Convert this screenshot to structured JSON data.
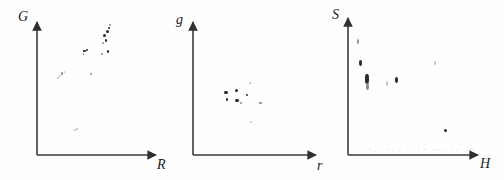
{
  "figure": {
    "type": "scatter-panel-figure",
    "panel_count": 3,
    "background_color": "#ffffff",
    "ink_color": "#2b2b2b",
    "axis_color": "#3a3a3a"
  },
  "chart_data": [
    {
      "type": "scatter",
      "title": "",
      "subtitle": "",
      "xlabel": "R",
      "ylabel": "G",
      "xlim": [
        0,
        1
      ],
      "ylim": [
        0,
        1
      ],
      "grid": false,
      "legend": "none",
      "annotations": [],
      "xticklabels": [],
      "yticklabels": [],
      "points": [
        {
          "x": 0.565,
          "y": 0.895,
          "size": 3.0,
          "tone": "dark"
        },
        {
          "x": 0.59,
          "y": 0.93,
          "size": 3.4,
          "tone": "dark"
        },
        {
          "x": 0.605,
          "y": 0.955,
          "size": 2.8,
          "tone": "dark"
        },
        {
          "x": 0.58,
          "y": 0.862,
          "size": 2.6,
          "tone": "dark"
        },
        {
          "x": 0.552,
          "y": 0.84,
          "size": 2.2,
          "tone": "soft"
        },
        {
          "x": 0.612,
          "y": 0.975,
          "size": 2.0,
          "tone": "soft"
        },
        {
          "x": 0.598,
          "y": 0.778,
          "size": 2.6,
          "tone": "dark"
        },
        {
          "x": 0.545,
          "y": 0.76,
          "size": 1.8,
          "tone": "soft"
        },
        {
          "x": 0.4,
          "y": 0.782,
          "size": 2.6,
          "tone": "dark"
        },
        {
          "x": 0.418,
          "y": 0.79,
          "size": 2.4,
          "tone": "dark"
        },
        {
          "x": 0.39,
          "y": 0.762,
          "size": 1.8,
          "tone": "soft"
        },
        {
          "x": 0.452,
          "y": 0.612,
          "size": 1.8,
          "tone": "soft"
        },
        {
          "x": 0.21,
          "y": 0.612,
          "size": 2.4,
          "tone": "soft"
        },
        {
          "x": 0.192,
          "y": 0.592,
          "size": 1.8,
          "tone": "faint"
        },
        {
          "x": 0.178,
          "y": 0.578,
          "size": 1.6,
          "tone": "faint"
        },
        {
          "x": 0.232,
          "y": 0.622,
          "size": 1.6,
          "tone": "faint"
        },
        {
          "x": 0.322,
          "y": 0.185,
          "size": 1.8,
          "tone": "faint"
        },
        {
          "x": 0.336,
          "y": 0.196,
          "size": 1.4,
          "tone": "faint"
        }
      ]
    },
    {
      "type": "scatter",
      "title": "",
      "subtitle": "",
      "xlabel": "r",
      "ylabel": "g",
      "xlim": [
        0,
        1
      ],
      "ylim": [
        0,
        1
      ],
      "grid": false,
      "legend": "none",
      "annotations": [],
      "xticklabels": [],
      "yticklabels": [],
      "points": [
        {
          "x": 0.268,
          "y": 0.47,
          "size": 3.2,
          "tone": "dark"
        },
        {
          "x": 0.276,
          "y": 0.418,
          "size": 2.6,
          "tone": "dark"
        },
        {
          "x": 0.352,
          "y": 0.488,
          "size": 3.0,
          "tone": "dark"
        },
        {
          "x": 0.358,
          "y": 0.408,
          "size": 3.4,
          "tone": "dark"
        },
        {
          "x": 0.388,
          "y": 0.392,
          "size": 2.2,
          "tone": "soft"
        },
        {
          "x": 0.438,
          "y": 0.452,
          "size": 2.2,
          "tone": "dark"
        },
        {
          "x": 0.462,
          "y": 0.54,
          "size": 1.6,
          "tone": "faint"
        },
        {
          "x": 0.548,
          "y": 0.392,
          "size": 2.4,
          "tone": "soft"
        },
        {
          "x": 0.47,
          "y": 0.248,
          "size": 1.8,
          "tone": "faint"
        }
      ]
    },
    {
      "type": "scatter",
      "title": "",
      "subtitle": "",
      "xlabel": "H",
      "ylabel": "S",
      "xlim": [
        0,
        1
      ],
      "ylim": [
        0,
        1
      ],
      "grid": false,
      "legend": "none",
      "annotations": [],
      "xticklabels": [],
      "yticklabels": [],
      "points": [
        {
          "x": 0.08,
          "y": 0.828,
          "size": 2.2,
          "tone": "soft",
          "shape": "vstreak"
        },
        {
          "x": 0.098,
          "y": 0.672,
          "size": 2.6,
          "tone": "dark",
          "shape": "vstreak"
        },
        {
          "x": 0.148,
          "y": 0.555,
          "size": 3.6,
          "tone": "dark",
          "shape": "vstreak"
        },
        {
          "x": 0.15,
          "y": 0.5,
          "size": 2.4,
          "tone": "soft",
          "shape": "vstreak"
        },
        {
          "x": 0.3,
          "y": 0.52,
          "size": 1.8,
          "tone": "faint",
          "shape": "vstreak"
        },
        {
          "x": 0.372,
          "y": 0.548,
          "size": 2.6,
          "tone": "dark",
          "shape": "vstreak"
        },
        {
          "x": 0.672,
          "y": 0.672,
          "size": 1.8,
          "tone": "faint",
          "shape": "vstreak"
        },
        {
          "x": 0.752,
          "y": 0.18,
          "size": 3.0,
          "tone": "dark"
        }
      ]
    }
  ]
}
